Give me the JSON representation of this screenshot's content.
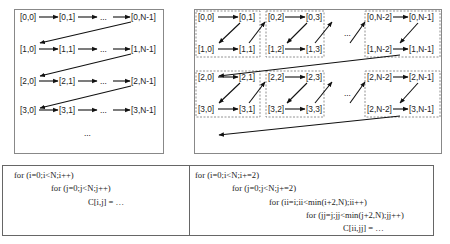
{
  "diagram": {
    "row_major": {
      "rows": [
        [
          "[0,0]",
          "[0,1]",
          "...",
          "[0,N-1]"
        ],
        [
          "[1,0]",
          "[1,1]",
          "...",
          "[1,N-1]"
        ],
        [
          "[2,0]",
          "[2,1]",
          "...",
          "[2,N-1]"
        ],
        [
          "[3,0]",
          "[3,1]",
          "...",
          "[3,N-1]"
        ]
      ],
      "trailing_ellipsis": "..."
    },
    "tiled": {
      "tiles_top": [
        {
          "tl": "[0,0]",
          "tr": "[0,1]",
          "bl": "[1,0]",
          "br": "[1,1]"
        },
        {
          "tl": "[0,2]",
          "tr": "[0,3]",
          "bl": "[1,2]",
          "br": "[1,3]"
        },
        {
          "tl": "[0,N-2]",
          "tr": "[0,N-1]",
          "bl": "[1,N-2]",
          "br": "[1,N-1]"
        }
      ],
      "tiles_bottom": [
        {
          "tl": "[2,0]",
          "tr": "[2,1]",
          "bl": "[3,0]",
          "br": "[3,1]"
        },
        {
          "tl": "[2,2]",
          "tr": "[2,3]",
          "bl": "[3,2]",
          "br": "[3,3]"
        },
        {
          "tl": "[2,N-2]",
          "tr": "[2,N-1]",
          "bl": "[2,N-2]",
          "br": "[3,N-1]"
        }
      ],
      "ellipsis": "..."
    }
  },
  "code": {
    "left": [
      "for (i=0;i<N;i++)",
      "for (j=0;j<N;j++)",
      "C[i,j] = …"
    ],
    "right": [
      "for (i=0;i<N;i+=2)",
      "for (j=0;j<N;j+=2)",
      "for (ii=i;ii<min(i+2,N);ii++)",
      "for (jj=j;jj<min(j+2,N);jj++)",
      "C[ii,jj] = …"
    ]
  }
}
